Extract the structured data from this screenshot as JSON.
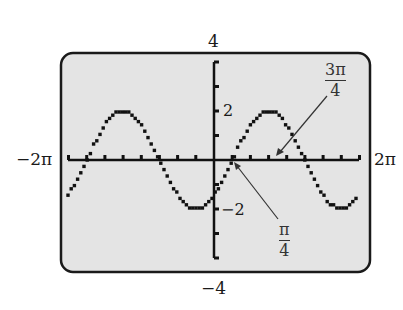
{
  "chart_data": {
    "type": "line",
    "title": "",
    "function": "y = 2 sin(x - π/4)",
    "xlabel": "",
    "ylabel": "",
    "xlim": [
      -6.2832,
      6.2832
    ],
    "ylim": [
      -4,
      4
    ],
    "x_range_labels": {
      "min": "−2π",
      "max": "2π"
    },
    "y_range_labels": {
      "max": "4",
      "min": "−4"
    },
    "y_tick_labels": [
      "2",
      "−2"
    ],
    "y_ticks": [
      -4,
      -3,
      -2,
      -1,
      1,
      2,
      3,
      4
    ],
    "x_ticks_step": "π/4",
    "grid": false,
    "amplitude": 2,
    "period": "2π",
    "phase_shift": "π/4",
    "annotations": [
      {
        "text_num": "π",
        "text_den": "4",
        "x": 0.7854,
        "y": 0,
        "note": "rising zero crossing"
      },
      {
        "text_num": "3π",
        "text_den": "4",
        "x": 2.3562,
        "y": 0,
        "note": "maximum location"
      }
    ],
    "series": [
      {
        "name": "y = 2 sin(x − π/4)",
        "style": "calculator pixel dots",
        "color": "#111111"
      }
    ]
  },
  "labels": {
    "ymax": "4",
    "ymin": "−4",
    "xmin": "−2π",
    "xmax": "2π",
    "ytick_pos": "2",
    "ytick_neg": "−2",
    "ann1_num": "π",
    "ann1_den": "4",
    "ann2_num": "3π",
    "ann2_den": "4"
  },
  "colors": {
    "screen_bg": "#e4e4e4",
    "frame": "#1a1a1a",
    "curve": "#111111",
    "arrow": "#333333"
  }
}
